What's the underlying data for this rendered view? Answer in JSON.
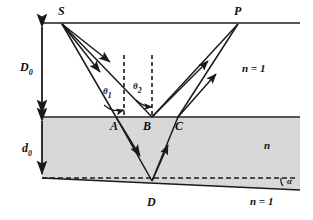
{
  "figure": {
    "colors": {
      "line": "#1a1a1a",
      "slab_fill": "#d8d8d8",
      "interface": "#555555",
      "background": "#ffffff"
    },
    "points": [
      {
        "id": "S",
        "label": "S",
        "x": 62,
        "y": 23
      },
      {
        "id": "P",
        "label": "P",
        "x": 238,
        "y": 23
      },
      {
        "id": "A",
        "label": "A",
        "x": 116,
        "y": 117
      },
      {
        "id": "B",
        "label": "B",
        "x": 146,
        "y": 117
      },
      {
        "id": "C",
        "label": "C",
        "x": 178,
        "y": 117
      },
      {
        "id": "D",
        "label": "D",
        "x": 152,
        "y": 181
      }
    ],
    "angles": [
      {
        "id": "theta1",
        "base": "θ",
        "sub": "1"
      },
      {
        "id": "theta2",
        "base": "θ",
        "sub": "2"
      },
      {
        "id": "alpha",
        "base": "α",
        "sub": ""
      }
    ],
    "dimensions": [
      {
        "id": "D0",
        "base": "D",
        "sub": "0"
      },
      {
        "id": "d0",
        "base": "d",
        "sub": "0"
      }
    ],
    "media": [
      {
        "id": "upper",
        "label": "n = 1"
      },
      {
        "id": "slab",
        "label": "n"
      },
      {
        "id": "lower",
        "label": "n = 1"
      }
    ]
  }
}
